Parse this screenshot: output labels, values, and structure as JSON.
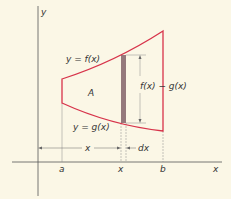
{
  "figure": {
    "colors": {
      "background": "#fbf7e6",
      "curve": "#d7334a",
      "strip": "#8a6a70",
      "axis": "#444444",
      "guide": "#888888"
    },
    "axes": {
      "x_label": "x",
      "y_label": "y"
    },
    "curves": {
      "upper_label": "y = f(x)",
      "lower_label": "y = g(x)"
    },
    "region_label": "A",
    "height_label": "f(x) − g(x)",
    "x_ticks": {
      "a": "a",
      "x": "x",
      "b": "b"
    },
    "distance_label": "x",
    "width_label": "dx"
  }
}
